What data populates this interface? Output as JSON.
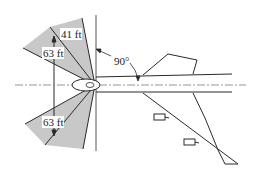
{
  "diagram": {
    "labels": {
      "upper_inner": "41 ft",
      "upper_outer": "63 ft",
      "lower_outer": "63 ft",
      "angle": "90°"
    },
    "colors": {
      "fan_fill": "#c8c8c8",
      "stroke": "#2a2a2a",
      "centerline": "#7a7a7a",
      "background": "#ffffff"
    }
  }
}
